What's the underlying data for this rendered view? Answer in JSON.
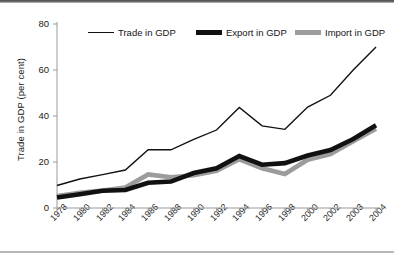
{
  "chart_data": {
    "type": "line",
    "title": "",
    "xlabel": "",
    "ylabel": "Trade in GDP (per cent)",
    "ylim": [
      0,
      80
    ],
    "yticks": [
      0,
      20,
      40,
      60,
      80
    ],
    "grid": false,
    "legend_position": "top",
    "categories": [
      "1978",
      "1980",
      "1982",
      "1984",
      "1986",
      "1988",
      "1990",
      "1992",
      "1994",
      "1996",
      "1998",
      "2000",
      "2002",
      "2003",
      "2004"
    ],
    "series": [
      {
        "name": "Trade in GDP",
        "color": "#111111",
        "width": 1.4,
        "values": [
          9.8,
          12.6,
          14.5,
          16.5,
          25.3,
          25.3,
          29.8,
          33.9,
          43.7,
          35.7,
          34.2,
          43.9,
          49.0,
          60.0,
          70.0
        ]
      },
      {
        "name": "Export in GDP",
        "color": "#111111",
        "width": 4.6,
        "values": [
          4.6,
          6.0,
          7.5,
          7.8,
          11.0,
          11.5,
          15.2,
          17.3,
          22.6,
          18.8,
          19.5,
          22.8,
          25.2,
          30.0,
          36.0
        ]
      },
      {
        "name": "Import in GDP",
        "color": "#9c9c9c",
        "width": 4.6,
        "values": [
          5.2,
          6.6,
          7.6,
          8.9,
          14.6,
          13.4,
          14.2,
          16.2,
          21.2,
          17.3,
          14.8,
          21.0,
          23.4,
          29.0,
          34.5
        ]
      }
    ]
  },
  "legend": {
    "items": [
      {
        "label": "Trade in GDP"
      },
      {
        "label": "Export in GDP"
      },
      {
        "label": "Import in GDP"
      }
    ]
  },
  "axes": {
    "y_title": "Trade in GDP (per cent)"
  }
}
